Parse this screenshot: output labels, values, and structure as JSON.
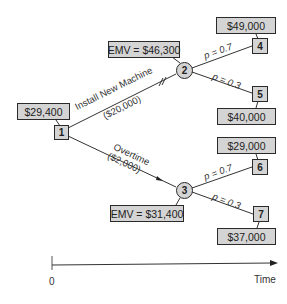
{
  "diagram": {
    "type": "decision-tree",
    "root": {
      "id": "1",
      "shape": "square",
      "value_label": "$29,400"
    },
    "branches": [
      {
        "label": "Install New Machine",
        "cost": "($20,000)",
        "to": "2"
      },
      {
        "label": "Overtime",
        "cost": "($2,000)",
        "to": "3"
      }
    ],
    "chance_nodes": [
      {
        "id": "2",
        "shape": "circle",
        "emv_label": "EMV = $46,300",
        "outcomes": [
          {
            "prob_label": "p = 0.7",
            "node": "4",
            "payoff": "$49,000"
          },
          {
            "prob_label": "p = 0.3",
            "node": "5",
            "payoff": "$40,000"
          }
        ]
      },
      {
        "id": "3",
        "shape": "circle",
        "emv_label": "EMV = $31,400",
        "outcomes": [
          {
            "prob_label": "p = 0.7",
            "node": "6",
            "payoff": "$29,000"
          },
          {
            "prob_label": "p = 0.3",
            "node": "7",
            "payoff": "$37,000"
          }
        ]
      }
    ],
    "axis": {
      "origin_label": "0",
      "end_label": "Time"
    },
    "colors": {
      "box_fill": "#d4d4d4",
      "stroke": "#2a2a2a"
    }
  }
}
